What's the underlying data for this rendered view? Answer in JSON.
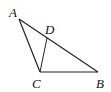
{
  "diagram": {
    "type": "triangle",
    "points": {
      "A": {
        "label": "A",
        "x": 19,
        "y": 19
      },
      "B": {
        "label": "B",
        "x": 98,
        "y": 72
      },
      "C": {
        "label": "C",
        "x": 40,
        "y": 72
      },
      "D": {
        "label": "D",
        "x": 47,
        "y": 38
      }
    },
    "segments": [
      "AB",
      "BC",
      "CA",
      "CD"
    ],
    "stroke": "#222222"
  }
}
